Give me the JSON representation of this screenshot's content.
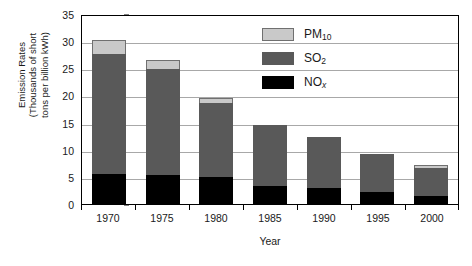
{
  "chart_data": {
    "type": "bar",
    "subtype": "stacked-vertical",
    "title": "",
    "xlabel": "Year",
    "ylabel": "Emission Rates (Thousands of short tons per billion kWh)",
    "ylabel_lines": [
      "Emission Rates",
      "(Thousands of short",
      "tons per billion kWh)"
    ],
    "categories": [
      "1970",
      "1975",
      "1980",
      "1985",
      "1990",
      "1995",
      "2000"
    ],
    "series": [
      {
        "name": "NOx",
        "legend_label": "NO",
        "legend_sub": "x",
        "color": "#000000",
        "values": [
          5.5,
          5.3,
          5.0,
          3.4,
          3.0,
          2.2,
          1.5
        ]
      },
      {
        "name": "SO2",
        "legend_label": "SO",
        "legend_sub": "2",
        "color": "#595959",
        "values": [
          22.2,
          19.6,
          13.6,
          11.1,
          9.3,
          7.1,
          5.2
        ]
      },
      {
        "name": "PM10",
        "legend_label": "PM",
        "legend_sub": "10",
        "color": "#c9c9c9",
        "values": [
          2.5,
          1.6,
          1.0,
          0.0,
          0.0,
          0.0,
          0.5
        ]
      }
    ],
    "totals": [
      30.2,
      26.5,
      19.6,
      14.5,
      12.3,
      9.3,
      7.2
    ],
    "ylim": [
      0,
      35
    ],
    "ytick_values": [
      0,
      5,
      10,
      15,
      20,
      25,
      30,
      35
    ],
    "ytick_labels": [
      "0",
      "5",
      "10",
      "15",
      "20",
      "25",
      "30",
      "35"
    ],
    "grid": "horizontal",
    "grid_color": "#a8a8a8",
    "legend_position": "top-right-inside",
    "plot_border": true
  }
}
